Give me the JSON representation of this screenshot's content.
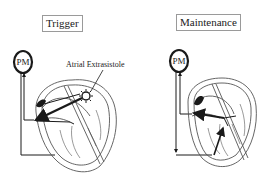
{
  "panels": [
    {
      "title": "Trigger",
      "pacemaker_label": "PM",
      "annotation": "Atrial Extrasistole"
    },
    {
      "title": "Maintenance",
      "pacemaker_label": "PM"
    }
  ],
  "colors": {
    "line": "#1a1a1a",
    "outline": "#555555",
    "title_border": "#9a9a9a",
    "background": "#ffffff"
  }
}
